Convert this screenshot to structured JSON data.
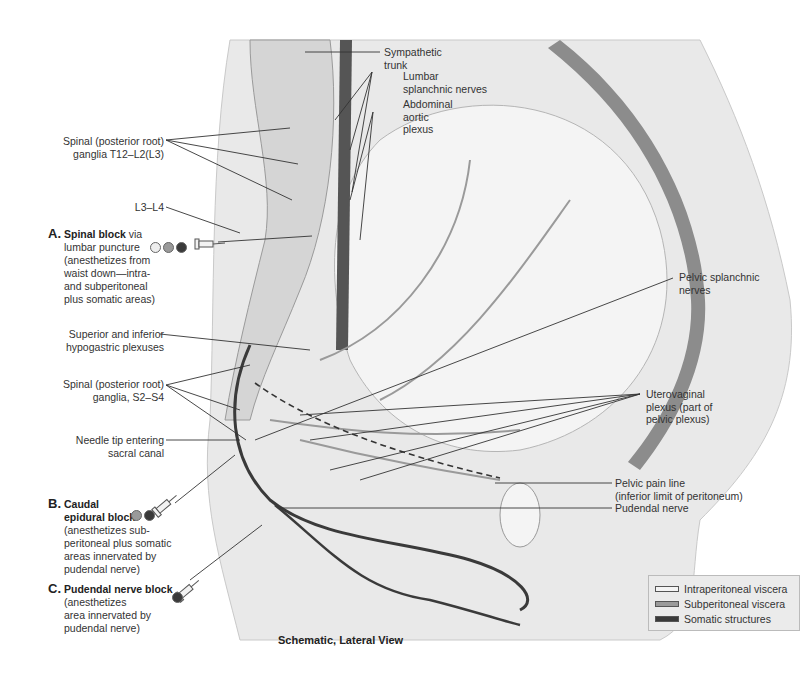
{
  "figure": {
    "caption": "Schematic, Lateral View",
    "colors": {
      "intraperitoneal": "#f4f4f4",
      "subperitoneal": "#9a9a9a",
      "somatic": "#3a3a3a",
      "background": "#ffffff",
      "body_fill": "#e6e6e6",
      "wall": "#8c8c8c"
    }
  },
  "labels": {
    "sympathetic_trunk": [
      "Sympathetic",
      "trunk"
    ],
    "lumbar_splanchnic": [
      "Lumbar",
      "splanchnic nerves"
    ],
    "abdominal_aortic_plexus": [
      "Abdominal",
      "aortic",
      "plexus"
    ],
    "spinal_ganglia_t12": [
      "Spinal (posterior root)",
      "ganglia T12–L2(L3)"
    ],
    "l3_l4": "L3–L4",
    "sup_inf_hypogastric": [
      "Superior and inferior",
      "hypogastric plexuses"
    ],
    "spinal_ganglia_s2": [
      "Spinal (posterior root)",
      "ganglia, S2–S4"
    ],
    "needle_tip": [
      "Needle tip entering",
      "sacral canal"
    ],
    "pelvic_splanchnic": [
      "Pelvic splanchnic",
      "nerves"
    ],
    "uterovaginal_plexus": [
      "Uterovaginal",
      "plexus (part of",
      "pelvic plexus)"
    ],
    "pelvic_pain_line": [
      "Pelvic pain line",
      "(inferior limit of peritoneum)"
    ],
    "pudendal_nerve": "Pudendal nerve"
  },
  "blocks": [
    {
      "letter": "A.",
      "title": "Spinal block",
      "title_suffix": " via",
      "lines": [
        "lumbar puncture",
        "(anesthetizes from",
        "waist down—intra-",
        "and subperitoneal",
        "plus somatic areas)"
      ],
      "dots": [
        "intraperitoneal",
        "subperitoneal",
        "somatic"
      ]
    },
    {
      "letter": "B.",
      "title": "Caudal",
      "title2": "epidural block",
      "lines": [
        "(anesthetizes sub-",
        "peritoneal plus somatic",
        "areas innervated by",
        "pudendal nerve)"
      ],
      "dots": [
        "subperitoneal",
        "somatic"
      ]
    },
    {
      "letter": "C.",
      "title": "Pudendal nerve block",
      "lines": [
        "(anesthetizes",
        "area innervated by",
        "pudendal nerve)"
      ],
      "dots": [
        "somatic"
      ]
    }
  ],
  "legend": {
    "items": [
      {
        "label": "Intraperitoneal viscera",
        "color": "#f4f4f4"
      },
      {
        "label": "Subperitoneal viscera",
        "color": "#9a9a9a"
      },
      {
        "label": "Somatic structures",
        "color": "#3a3a3a"
      }
    ]
  }
}
